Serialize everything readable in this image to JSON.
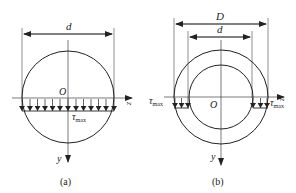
{
  "figure_a": {
    "dim_label": "d",
    "origin_label": "O",
    "z_label": "z",
    "y_label": "y",
    "stress_label": "τ",
    "stress_sub": "max",
    "caption": "(a)"
  },
  "figure_b": {
    "outer_dim_label": "D",
    "inner_dim_label": "d",
    "origin_label": "O",
    "z_label": "z",
    "y_label": "y",
    "stress_label_left": "τ",
    "stress_sub_left": "max",
    "stress_label_right": "τ",
    "stress_sub_right": "max",
    "caption": "(b)"
  }
}
